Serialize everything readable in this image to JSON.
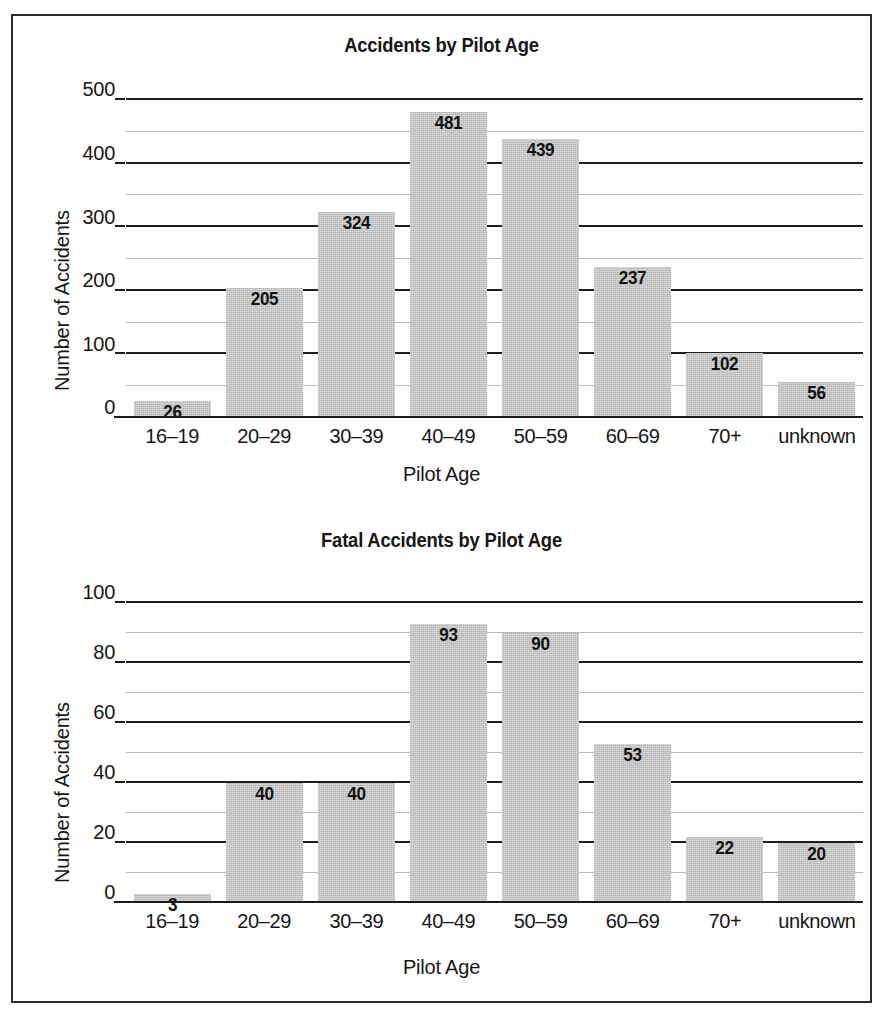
{
  "figure": {
    "background": "#ffffff",
    "border_color": "#2b2b2b",
    "bar_color": "#b6b6b6",
    "gridline_major_color": "#1e1e1e",
    "gridline_minor_color": "#b9b9b9"
  },
  "chart_data": [
    {
      "type": "bar",
      "title": "Accidents by Pilot Age",
      "xlabel": "Pilot Age",
      "ylabel": "Number of Accidents",
      "categories": [
        "16–19",
        "20–29",
        "30–39",
        "40–49",
        "50–59",
        "60–69",
        "70+",
        "unknown"
      ],
      "values": [
        26,
        205,
        324,
        481,
        439,
        237,
        102,
        56
      ],
      "value_labels": [
        "26",
        "205",
        "324",
        "481",
        "439",
        "237",
        "102",
        "56"
      ],
      "ylim": [
        0,
        500
      ],
      "yticks": [
        0,
        100,
        200,
        300,
        400,
        500
      ],
      "ytick_labels": [
        "0",
        "100",
        "200",
        "300",
        "400",
        "500"
      ],
      "yticks_minor": [
        50,
        150,
        250,
        350,
        450
      ],
      "grid": true,
      "legend": "none"
    },
    {
      "type": "bar",
      "title": "Fatal Accidents by Pilot Age",
      "xlabel": "Pilot Age",
      "ylabel": "Number of Accidents",
      "categories": [
        "16–19",
        "20–29",
        "30–39",
        "40–49",
        "50–59",
        "60–69",
        "70+",
        "unknown"
      ],
      "values": [
        3,
        40,
        40,
        93,
        90,
        53,
        22,
        20
      ],
      "value_labels": [
        "3",
        "40",
        "40",
        "93",
        "90",
        "53",
        "22",
        "20"
      ],
      "ylim": [
        0,
        100
      ],
      "yticks": [
        0,
        20,
        40,
        60,
        80,
        100
      ],
      "ytick_labels": [
        "0",
        "20",
        "40",
        "60",
        "80",
        "100"
      ],
      "yticks_minor": [
        10,
        30,
        50,
        70,
        90
      ],
      "grid": true,
      "legend": "none"
    }
  ]
}
